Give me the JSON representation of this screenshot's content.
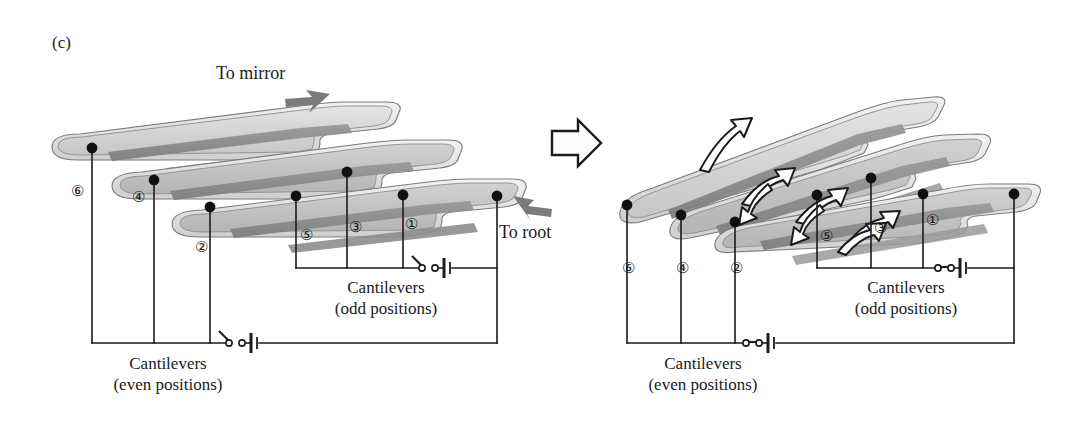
{
  "figure": {
    "panel_tag": "(c)",
    "type": "schematic-diagram",
    "background": "#ffffff",
    "ink": "#1b1b1b"
  },
  "direction_labels": {
    "to_mirror": "To mirror",
    "to_root": "To root"
  },
  "transition_arrow": {
    "name": "state-transition-arrow",
    "style": "hollow-outline",
    "direction": "right"
  },
  "captions": {
    "odd_line1": "Cantilevers",
    "odd_line2": "(odd positions)",
    "even_line1": "Cantilevers",
    "even_line2": "(even positions)"
  },
  "cantilever_numbers": {
    "odd": [
      "①",
      "③",
      "⑤"
    ],
    "even": [
      "②",
      "④",
      "⑥"
    ]
  },
  "left_panel": {
    "name": "undeflected-state",
    "switch_state": "open",
    "beam_count": 3,
    "node_labels_odd": [
      {
        "symbol": "①",
        "x": 411,
        "y": 226
      },
      {
        "symbol": "③",
        "x": 356,
        "y": 229
      },
      {
        "symbol": "⑤",
        "x": 307,
        "y": 237
      }
    ],
    "node_labels_even": [
      {
        "symbol": "②",
        "x": 202,
        "y": 249
      },
      {
        "symbol": "④",
        "x": 139,
        "y": 199
      },
      {
        "symbol": "⑥",
        "x": 78,
        "y": 193
      }
    ]
  },
  "right_panel": {
    "name": "actuated-state",
    "switch_state": "closed",
    "beam_count": 3,
    "rotation_arrows": 7,
    "node_labels_odd": [
      {
        "symbol": "①",
        "x": 933,
        "y": 222
      },
      {
        "symbol": "③",
        "x": 882,
        "y": 230
      },
      {
        "symbol": "⑤",
        "x": 827,
        "y": 238
      }
    ],
    "node_labels_even": [
      {
        "symbol": "②",
        "x": 744,
        "y": 270
      },
      {
        "symbol": "④",
        "x": 681,
        "y": 270
      },
      {
        "symbol": "⑥",
        "x": 633,
        "y": 270
      }
    ]
  },
  "colors": {
    "beam_light": "#d9d9d9",
    "beam_mid": "#b9b9b9",
    "beam_dark": "#8a8a8a",
    "beam_edge": "#6e6e6e",
    "wire": "#1b1b1b",
    "node_dot": "#101010",
    "arrow_fill": "#ffffff",
    "solid_arrow": "#7a7a7a"
  }
}
